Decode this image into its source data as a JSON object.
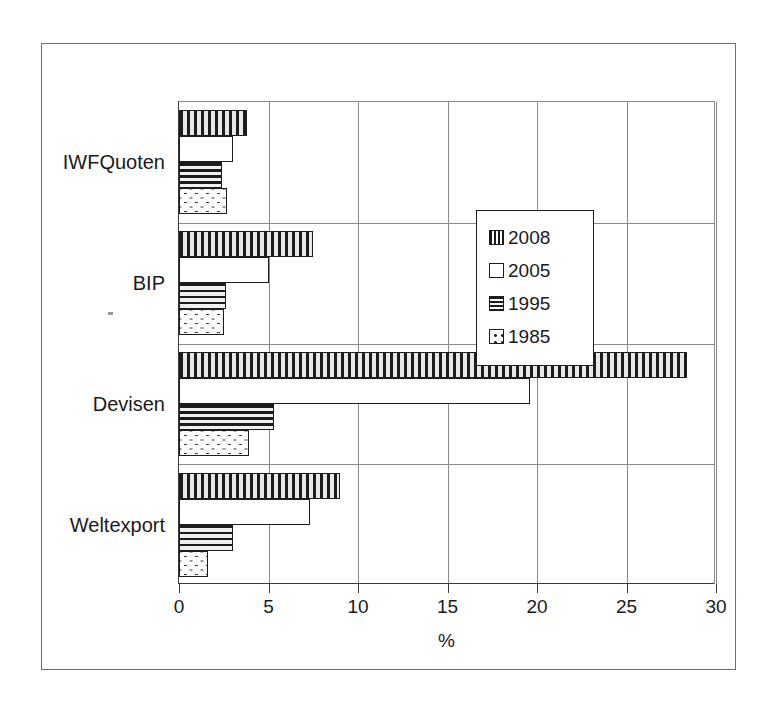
{
  "chart_data": {
    "type": "bar",
    "orientation": "horizontal",
    "title": "",
    "xlabel": "%",
    "ylabel": "",
    "xlim": [
      0,
      30
    ],
    "xticks": [
      0,
      5,
      10,
      15,
      20,
      25,
      30
    ],
    "xtick_labels": [
      "0",
      "5",
      "10",
      "15",
      "20",
      "25",
      "30"
    ],
    "grid": "vertical",
    "categories": [
      "IWFQuoten",
      "BIP",
      "Devisen",
      "Weltexport"
    ],
    "legend_position": "center-right-inside",
    "series": [
      {
        "name": "2008",
        "pattern": "vertical-stripes",
        "values": [
          3.8,
          7.5,
          28.4,
          9.0
        ]
      },
      {
        "name": "2005",
        "pattern": "blank",
        "values": [
          3.0,
          5.0,
          19.6,
          7.3
        ]
      },
      {
        "name": "1995",
        "pattern": "horizontal-stripes",
        "values": [
          2.4,
          2.6,
          5.3,
          3.0
        ]
      },
      {
        "name": "1985",
        "pattern": "dotted",
        "values": [
          2.7,
          2.5,
          3.9,
          1.6
        ]
      }
    ]
  },
  "legend": {
    "entries": [
      {
        "label": "2008",
        "pattern": "vertical-stripes"
      },
      {
        "label": "2005",
        "pattern": "blank"
      },
      {
        "label": "1995",
        "pattern": "horizontal-stripes"
      },
      {
        "label": "1985",
        "pattern": "dotted"
      }
    ]
  },
  "axis": {
    "x_title": "%",
    "ticks": [
      "0",
      "5",
      "10",
      "15",
      "20",
      "25",
      "30"
    ]
  },
  "categories": [
    "IWFQuoten",
    "BIP",
    "Devisen",
    "Weltexport"
  ]
}
